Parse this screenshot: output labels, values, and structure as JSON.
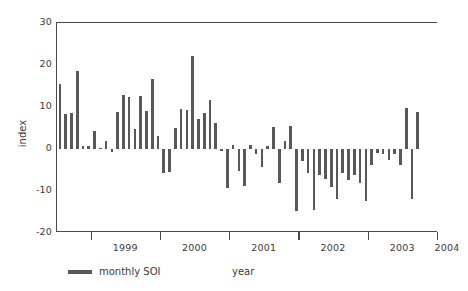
{
  "chart_data": {
    "type": "bar",
    "title": "",
    "xlabel": "year",
    "ylabel": "index",
    "ylim": [
      -20,
      30
    ],
    "yticks": [
      30,
      20,
      10,
      0,
      -10,
      -20
    ],
    "xlim": [
      1998.5,
      2004.0
    ],
    "xticks": [
      1999,
      2000,
      2001,
      2002,
      2003,
      2004
    ],
    "xtick_labels": [
      "1999",
      "2000",
      "2001",
      "2002",
      "2003",
      "2004"
    ],
    "grid": false,
    "legend": [
      {
        "label": "monthly SOI",
        "color": "#585858",
        "marker": "line-swatch"
      }
    ],
    "legend_position": "below-left",
    "series_name": "monthly SOI",
    "bar_color": "#585858",
    "axis_color": "#4a4a4a",
    "categories": [
      "1998-07",
      "1998-08",
      "1998-09",
      "1998-10",
      "1998-11",
      "1998-12",
      "1999-01",
      "1999-02",
      "1999-03",
      "1999-04",
      "1999-05",
      "1999-06",
      "1999-07",
      "1999-08",
      "1999-09",
      "1999-10",
      "1999-11",
      "1999-12",
      "2000-01",
      "2000-02",
      "2000-03",
      "2000-04",
      "2000-05",
      "2000-06",
      "2000-07",
      "2000-08",
      "2000-09",
      "2000-10",
      "2000-11",
      "2000-12",
      "2001-01",
      "2001-02",
      "2001-03",
      "2001-04",
      "2001-05",
      "2001-06",
      "2001-07",
      "2001-08",
      "2001-09",
      "2001-10",
      "2001-11",
      "2001-12",
      "2002-01",
      "2002-02",
      "2002-03",
      "2002-04",
      "2002-05",
      "2002-06",
      "2002-07",
      "2002-08",
      "2002-09",
      "2002-10",
      "2002-11",
      "2002-12",
      "2003-01",
      "2003-02",
      "2003-03",
      "2003-04",
      "2003-05",
      "2003-06",
      "2003-07",
      "2003-08",
      "2003-09",
      "2003-10"
    ],
    "values": [
      15.5,
      8.3,
      8.5,
      18.5,
      0.8,
      0.6,
      4.4,
      0.2,
      1.8,
      -0.6,
      8.9,
      12.8,
      12.5,
      4.8,
      12.6,
      9.0,
      16.6,
      3.2,
      -5.8,
      -5.5,
      4.9,
      9.6,
      9.4,
      22.2,
      7.2,
      8.6,
      11.7,
      6.3,
      -0.4,
      -9.4,
      1.0,
      -5.3,
      -8.8,
      0.9,
      -1.2,
      -4.4,
      0.7,
      5.2,
      -8.0,
      2.0,
      5.4,
      -14.8,
      -2.8,
      -5.6,
      -14.6,
      -6.1,
      -7.2,
      -9.0,
      -11.9,
      -5.8,
      -7.3,
      -6.3,
      -8.1,
      -12.3,
      -3.9,
      -1.0,
      -1.2,
      -2.5,
      -1.3,
      -3.8,
      9.7,
      -11.8,
      8.8,
      0.0
    ]
  }
}
